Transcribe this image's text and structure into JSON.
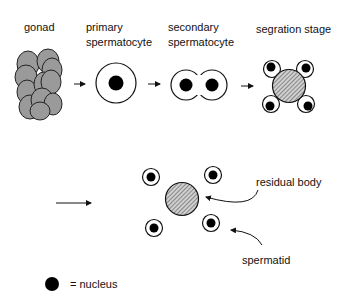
{
  "labels": {
    "gonad": "gonad",
    "primary_line1": "primary",
    "primary_line2": "spermatocyte",
    "secondary_line1": "secondary",
    "secondary_line2": "spermatocyte",
    "segregation": "segration stage",
    "residual_body": "residual body",
    "spermatid": "spermatid",
    "legend": "= nucleus"
  },
  "colors": {
    "gonad_cell": "#9a9a9a",
    "nucleus": "#000000",
    "outline": "#111111",
    "residual_hatch": "#888888"
  }
}
